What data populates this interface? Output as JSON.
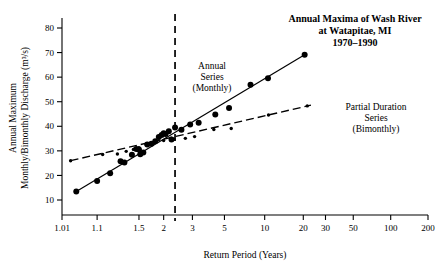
{
  "chart_data": {
    "type": "scatter",
    "title_lines": [
      "Annual Maxima of Wash River",
      "at Watapitae, MI",
      "1970–1990"
    ],
    "xlabel": "Return Period (Years)",
    "ylabel": "Annual Maximum Monthly/Bimonthly Discharge (m³/s)",
    "ylabel_lines": [
      "Annual Maximum",
      "Monthly/Bimonthly Discharge (m³/s)"
    ],
    "xscale": "probability-gumbel",
    "xlim": [
      1.01,
      200
    ],
    "ylim": [
      0,
      88
    ],
    "grid": false,
    "legend_position": "inline-annotations",
    "xticks": [
      {
        "label": "1.01",
        "value": 1.01
      },
      {
        "label": "1.1",
        "value": 1.1
      },
      {
        "label": "1.5",
        "value": 1.5
      },
      {
        "label": "2",
        "value": 2
      },
      {
        "label": "3",
        "value": 3
      },
      {
        "label": "5",
        "value": 5
      },
      {
        "label": "10",
        "value": 10
      },
      {
        "label": "20",
        "value": 20
      },
      {
        "label": "30",
        "value": 30
      },
      {
        "label": "50",
        "value": 50
      },
      {
        "label": "100",
        "value": 100
      },
      {
        "label": "200",
        "value": 200
      }
    ],
    "yticks": [
      {
        "label": "10",
        "value": 10
      },
      {
        "label": "20",
        "value": 20
      },
      {
        "label": "30",
        "value": 30
      },
      {
        "label": "40",
        "value": 40
      },
      {
        "label": "50",
        "value": 50
      },
      {
        "label": "60",
        "value": 60
      },
      {
        "label": "70",
        "value": 70
      },
      {
        "label": "80",
        "value": 80
      }
    ],
    "reference_line": {
      "label": "",
      "value": 2.33,
      "style": "dashed-vertical"
    },
    "series": [
      {
        "name": "Annual Series (Monthly)",
        "annotation_lines": [
          "Annual",
          "Series",
          "(Monthly)"
        ],
        "marker": "filled-circle",
        "marker_size": "large",
        "line_style": "solid",
        "color": "#000000",
        "points": [
          {
            "x": 1.03,
            "y": 13.5
          },
          {
            "x": 1.1,
            "y": 17.7
          },
          {
            "x": 1.18,
            "y": 20.9
          },
          {
            "x": 1.27,
            "y": 25.8
          },
          {
            "x": 1.31,
            "y": 25.3
          },
          {
            "x": 1.4,
            "y": 28.4
          },
          {
            "x": 1.46,
            "y": 30.8
          },
          {
            "x": 1.5,
            "y": 30.6
          },
          {
            "x": 1.52,
            "y": 28.6
          },
          {
            "x": 1.57,
            "y": 29.3
          },
          {
            "x": 1.64,
            "y": 32.6
          },
          {
            "x": 1.72,
            "y": 32.9
          },
          {
            "x": 1.8,
            "y": 33.9
          },
          {
            "x": 1.88,
            "y": 35.6
          },
          {
            "x": 1.95,
            "y": 36.5
          },
          {
            "x": 2.0,
            "y": 37.2
          },
          {
            "x": 2.05,
            "y": 36.9
          },
          {
            "x": 2.14,
            "y": 38.0
          },
          {
            "x": 2.22,
            "y": 34.6
          },
          {
            "x": 2.33,
            "y": 39.5
          },
          {
            "x": 2.55,
            "y": 38.6
          },
          {
            "x": 2.9,
            "y": 40.7
          },
          {
            "x": 3.3,
            "y": 41.4
          },
          {
            "x": 4.3,
            "y": 44.8
          },
          {
            "x": 5.4,
            "y": 47.4
          },
          {
            "x": 7.8,
            "y": 56.9
          },
          {
            "x": 10.6,
            "y": 59.5
          },
          {
            "x": 20.5,
            "y": 69.1
          }
        ],
        "fit_line": {
          "from": {
            "x": 1.03,
            "y": 13.5
          },
          "to": {
            "x": 20.5,
            "y": 69.1
          }
        }
      },
      {
        "name": "Partial Duration Series (Bimonthly)",
        "annotation_lines": [
          "Partial Duration",
          "Series",
          "(Bimonthly)"
        ],
        "marker": "filled-circle",
        "marker_size": "small",
        "line_style": "dashed",
        "color": "#000000",
        "points": [
          {
            "x": 1.02,
            "y": 26.0
          },
          {
            "x": 1.13,
            "y": 28.5
          },
          {
            "x": 1.24,
            "y": 28.7
          },
          {
            "x": 1.33,
            "y": 29.8
          },
          {
            "x": 1.42,
            "y": 30.6
          },
          {
            "x": 1.5,
            "y": 31.3
          },
          {
            "x": 1.62,
            "y": 32.6
          },
          {
            "x": 1.78,
            "y": 33.4
          },
          {
            "x": 2.0,
            "y": 34.2
          },
          {
            "x": 2.3,
            "y": 34.7
          },
          {
            "x": 2.7,
            "y": 35.1
          },
          {
            "x": 3.1,
            "y": 35.8
          },
          {
            "x": 4.2,
            "y": 38.7
          },
          {
            "x": 5.6,
            "y": 39.1
          },
          {
            "x": 10.7,
            "y": 44.6
          },
          {
            "x": 21.5,
            "y": 48.3
          }
        ],
        "fit_line": {
          "from": {
            "x": 1.02,
            "y": 26.0
          },
          "to": {
            "x": 23.0,
            "y": 48.6
          }
        }
      }
    ]
  }
}
